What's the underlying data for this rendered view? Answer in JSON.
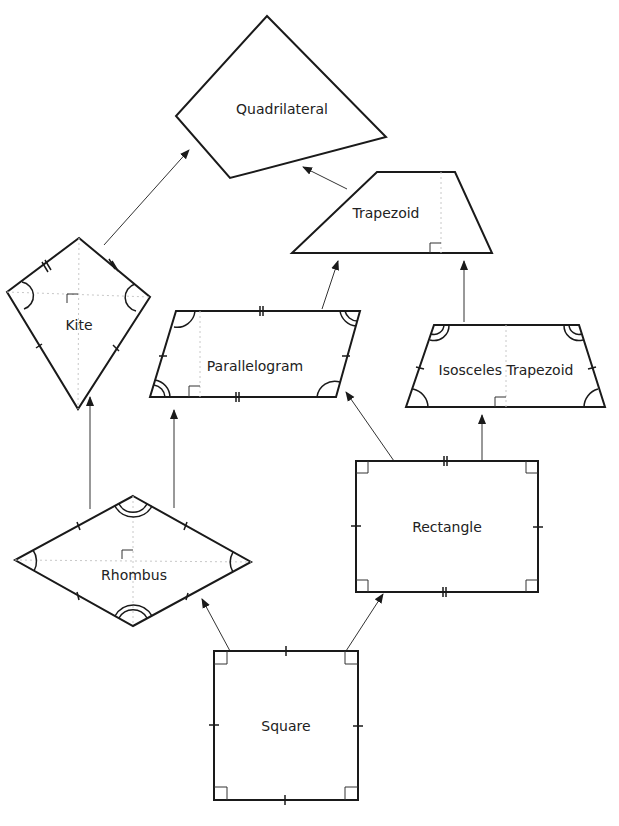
{
  "diagram": {
    "colors": {
      "stroke": "#1a1a1a",
      "guide": "#c8c8c8",
      "background": "#ffffff"
    },
    "nodes": {
      "quadrilateral": {
        "label": "Quadrilateral"
      },
      "trapezoid": {
        "label": "Trapezoid"
      },
      "kite": {
        "label": "Kite"
      },
      "parallelogram": {
        "label": "Parallelogram"
      },
      "isosceles_trapezoid": {
        "label": "Isosceles Trapezoid"
      },
      "rhombus": {
        "label": "Rhombus"
      },
      "rectangle": {
        "label": "Rectangle"
      },
      "square": {
        "label": "Square"
      }
    },
    "edges": [
      {
        "from": "Kite",
        "to": "Quadrilateral"
      },
      {
        "from": "Trapezoid",
        "to": "Quadrilateral"
      },
      {
        "from": "Parallelogram",
        "to": "Trapezoid"
      },
      {
        "from": "Isosceles Trapezoid",
        "to": "Trapezoid"
      },
      {
        "from": "Rhombus",
        "to": "Kite"
      },
      {
        "from": "Rhombus",
        "to": "Parallelogram"
      },
      {
        "from": "Rectangle",
        "to": "Parallelogram"
      },
      {
        "from": "Rectangle",
        "to": "Isosceles Trapezoid"
      },
      {
        "from": "Square",
        "to": "Rhombus"
      },
      {
        "from": "Square",
        "to": "Rectangle"
      }
    ]
  }
}
